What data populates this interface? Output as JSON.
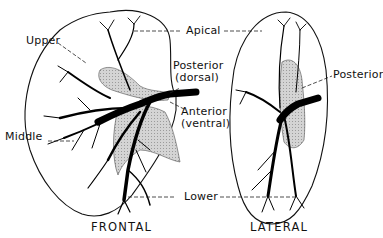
{
  "figure": {
    "views": [
      {
        "id": "frontal",
        "caption": "FRONTAL"
      },
      {
        "id": "lateral",
        "caption": "LATERAL"
      }
    ],
    "labels": {
      "apical": "Apical",
      "upper": "Upper",
      "posterior_dorsal_line1": "Posterior",
      "posterior_dorsal_line2": "(dorsal)",
      "anterior_ventral_line1": "Anterior",
      "anterior_ventral_line2": "(ventral)",
      "middle": "Middle",
      "lower": "Lower",
      "posterior": "Posterior"
    },
    "colors": {
      "ink": "#111111",
      "shaded_segment": "#c8c8c8",
      "background": "#ffffff"
    }
  }
}
